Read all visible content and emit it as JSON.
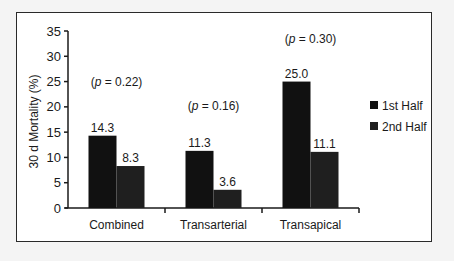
{
  "chart_data": {
    "type": "bar",
    "title": "",
    "xlabel": "",
    "ylabel": "30 d Mortality (%)",
    "ylim": [
      0,
      35
    ],
    "yticks": [
      0,
      5,
      10,
      15,
      20,
      25,
      30,
      35
    ],
    "categories": [
      "Combined",
      "Transarterial",
      "Transapical"
    ],
    "series": [
      {
        "name": "1st Half",
        "values": [
          14.3,
          11.3,
          25.0
        ],
        "color": "#111111"
      },
      {
        "name": "2nd Half",
        "values": [
          8.3,
          3.6,
          11.1
        ],
        "color": "#1f1f1f"
      }
    ],
    "value_labels": [
      [
        "14.3",
        "8.3"
      ],
      [
        "11.3",
        "3.6"
      ],
      [
        "25.0",
        "11.1"
      ]
    ],
    "annotations": [
      "(p = 0.22)",
      "(p = 0.16)",
      "(p = 0.30)"
    ],
    "grid": false,
    "legend_position": "right"
  }
}
